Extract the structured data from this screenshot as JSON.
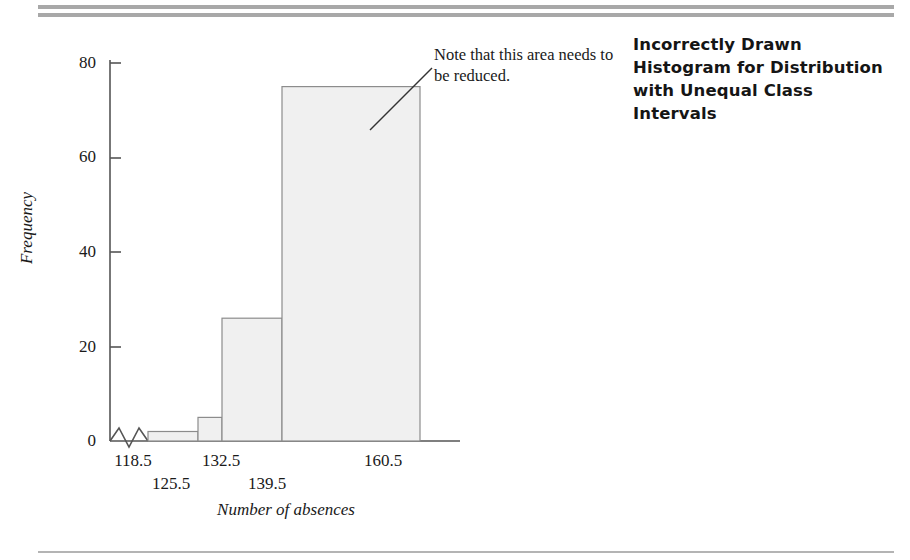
{
  "figure": {
    "title": "Incorrectly Drawn Histogram for Distribution with Unequal Class Intervals",
    "annotation": "Note that this area needs to be reduced.",
    "xlabel": "Number of absences",
    "ylabel": "Frequency"
  },
  "colors": {
    "bar_fill": "#f0f0f0",
    "bar_stroke": "#8c8c8c",
    "axis": "#555555",
    "rule": "#a8a8a8",
    "text": "#1a1a1a"
  },
  "chart_data": {
    "type": "bar",
    "title": "Incorrectly Drawn Histogram for Distribution with Unequal Class Intervals",
    "xlabel": "Number of absences",
    "ylabel": "Frequency",
    "ylim": [
      0,
      80
    ],
    "yticks": [
      "0",
      "20",
      "40",
      "60",
      "80"
    ],
    "ytick_values": [
      0,
      20,
      40,
      60,
      80
    ],
    "xticks": [
      "118.5",
      "125.5",
      "132.5",
      "139.5",
      "160.5"
    ],
    "xtick_values": [
      118.5,
      125.5,
      132.5,
      139.5,
      160.5
    ],
    "grid": false,
    "legend": null,
    "axis_break": true,
    "bins": [
      {
        "lower": 118.5,
        "upper": 125.5,
        "frequency": 2
      },
      {
        "lower": 125.5,
        "upper": 132.5,
        "frequency": 5
      },
      {
        "lower": 132.5,
        "upper": 139.5,
        "frequency": 26
      },
      {
        "lower": 139.5,
        "upper": 160.5,
        "frequency": 75
      }
    ],
    "categories": [
      "118.5-125.5",
      "125.5-132.5",
      "132.5-139.5",
      "139.5-160.5"
    ],
    "values": [
      2,
      5,
      26,
      75
    ],
    "annotations": [
      {
        "text": "Note that this area needs to be reduced.",
        "target_bin": "139.5-160.5"
      }
    ]
  },
  "yticks": [
    {
      "label": "80",
      "top": "53px"
    },
    {
      "label": "60",
      "top": "147px"
    },
    {
      "label": "40",
      "top": "242px"
    },
    {
      "label": "20",
      "top": "337px"
    },
    {
      "label": "0",
      "top": "431px"
    }
  ],
  "xticks": [
    {
      "label": "118.5",
      "left": "98px",
      "top": "451px"
    },
    {
      "label": "125.5",
      "left": "136px",
      "top": "474px"
    },
    {
      "label": "132.5",
      "left": "186px",
      "top": "451px"
    },
    {
      "label": "139.5",
      "left": "232px",
      "top": "474px"
    },
    {
      "label": "160.5",
      "left": "348px",
      "top": "451px"
    }
  ]
}
